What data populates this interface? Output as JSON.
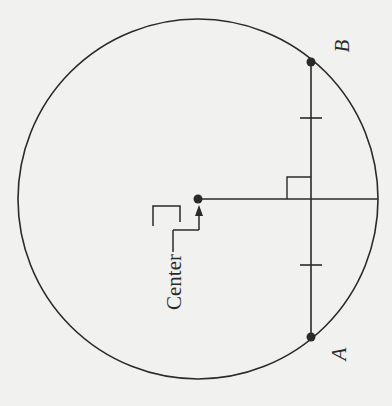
{
  "diagram": {
    "type": "geometry",
    "colors": {
      "background": "#f1f1ef",
      "stroke": "#2a2a2a"
    },
    "circle": {
      "cx": 198,
      "cy": 199,
      "r": 180
    },
    "center_point": {
      "x": 198,
      "y": 199,
      "label": "Center"
    },
    "chord": {
      "x": 311,
      "y1": 62,
      "y2": 337
    },
    "radius_segment": {
      "x1": 198,
      "x2": 378,
      "y": 199
    },
    "points": [
      {
        "name": "B",
        "x": 311,
        "y": 62,
        "label": "B"
      },
      {
        "name": "A",
        "x": 311,
        "y": 337,
        "label": "A"
      }
    ],
    "tick_marks": [
      {
        "y": 118
      },
      {
        "y": 265
      }
    ],
    "right_angle_marker": {
      "x": 287,
      "y": 177,
      "size": 23
    },
    "labels": {
      "center": "Center",
      "a": "A",
      "b": "B"
    }
  }
}
